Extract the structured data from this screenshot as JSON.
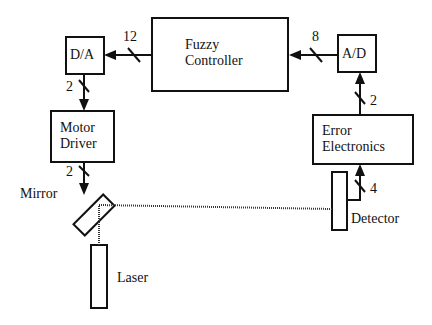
{
  "blocks": {
    "fuzzy": {
      "line1": "Fuzzy",
      "line2": "Controller"
    },
    "da": "D/A",
    "ad": "A/D",
    "motor": {
      "line1": "Motor",
      "line2": "Driver"
    },
    "error": {
      "line1": "Error",
      "line2": "Electronics"
    }
  },
  "components": {
    "mirror": "Mirror",
    "laser": "Laser",
    "detector": "Detector"
  },
  "bus_widths": {
    "fuzzy_to_da": "12",
    "ad_to_fuzzy": "8",
    "da_to_motor": "2",
    "motor_to_mirror": "2",
    "error_to_ad": "2",
    "detector_to_error": "4"
  }
}
